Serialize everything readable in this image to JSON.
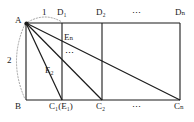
{
  "figure": {
    "stroke_color": "#1a1a1a",
    "background_color": "#ffffff",
    "vertices": {
      "A": {
        "label": "A",
        "x": 26,
        "y": 23
      },
      "B": {
        "label": "B",
        "x": 26,
        "y": 100
      },
      "D1": {
        "label": "D",
        "sub": "1",
        "x": 62,
        "y": 23
      },
      "D2": {
        "label": "D",
        "sub": "2",
        "x": 102,
        "y": 23
      },
      "Dn": {
        "label": "D",
        "sub": "n",
        "x": 180,
        "y": 23
      },
      "C1": {
        "label": "C",
        "sub": "1",
        "x": 62,
        "y": 100
      },
      "C2": {
        "label": "C",
        "sub": "2",
        "x": 102,
        "y": 100
      },
      "Cn": {
        "label": "C",
        "sub": "n",
        "x": 180,
        "y": 100
      }
    },
    "point_labels": {
      "a": "A",
      "b": "B",
      "d1": "D₁",
      "d2": "D₂",
      "dn": "Dₙ",
      "c1_e1": "C₁(E₁)",
      "c2": "C₂",
      "cn": "Cₙ",
      "e2": "E₂",
      "en": "Eₙ"
    },
    "dimensions": {
      "top_label": "1",
      "left_label": "2"
    },
    "ellipsis": {
      "top": "⋯",
      "bottom": "⋯",
      "vertical": "⋮"
    },
    "segments": [
      {
        "name": "rectangle-top",
        "from": "A",
        "to": "Dn"
      },
      {
        "name": "rectangle-left",
        "from": "A",
        "to": "B"
      },
      {
        "name": "rectangle-bottom",
        "from": "B",
        "to": "Cn"
      },
      {
        "name": "rectangle-right",
        "from": "Dn",
        "to": "Cn"
      },
      {
        "name": "vertical-d1-c1",
        "from": "D1",
        "to": "C1"
      },
      {
        "name": "vertical-d2-c2",
        "from": "D2",
        "to": "C2"
      },
      {
        "name": "diagonal-a-c1",
        "from": "A",
        "to": "C1"
      },
      {
        "name": "diagonal-a-c2",
        "from": "A",
        "to": "C2"
      },
      {
        "name": "diagonal-a-cn",
        "from": "A",
        "to": "Cn"
      }
    ],
    "arcs": [
      {
        "name": "arc-top-dimension",
        "label": "1",
        "style": "dotted"
      },
      {
        "name": "arc-left-dimension",
        "label": "2",
        "style": "dotted"
      }
    ]
  }
}
